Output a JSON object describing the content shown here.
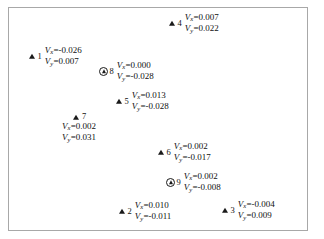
{
  "figure": {
    "background_color": "#ffffff",
    "border_color": "#a8a8a8",
    "marker_color": "#1a1a1a",
    "symbol_vx": "V",
    "symbol_vy": "V",
    "sub_x": "x",
    "sub_y": "y",
    "eq": "="
  },
  "chart_data": {
    "type": "scatter",
    "title": "",
    "xlabel": "",
    "ylabel": "",
    "grid": false,
    "legend": null,
    "annotation_format": "Vx=<value>, Vy=<value>",
    "points": [
      {
        "id": "1",
        "label": "1",
        "marker": "triangle",
        "vx": "-0.026",
        "vy": "0.007",
        "vx_text": "V_x=-0.026",
        "vy_text": "V_y=0.007",
        "px": 27,
        "py": 45,
        "layout": "inline"
      },
      {
        "id": "8",
        "label": "8",
        "marker": "circled-triangle",
        "vx": "0.000",
        "vy": "-0.028",
        "vx_text": "V_x=0.000",
        "vy_text": "V_y=-0.028",
        "px": 99,
        "py": 60,
        "layout": "inline"
      },
      {
        "id": "4",
        "label": "4",
        "marker": "triangle",
        "vx": "0.007",
        "vy": "0.022",
        "vx_text": "V_x=0.007",
        "vy_text": "V_y=0.022",
        "px": 167,
        "py": 12,
        "layout": "inline"
      },
      {
        "id": "5",
        "label": "5",
        "marker": "triangle",
        "vx": "0.013",
        "vy": "-0.028",
        "vx_text": "V_x=0.013",
        "vy_text": "V_y=-0.028",
        "px": 114,
        "py": 90,
        "layout": "inline"
      },
      {
        "id": "7",
        "label": "7",
        "marker": "triangle",
        "vx": "0.002",
        "vy": "0.031",
        "vx_text": "V_x=0.002",
        "vy_text": "V_y=0.031",
        "px": 62,
        "py": 112,
        "layout": "stacked"
      },
      {
        "id": "6",
        "label": "6",
        "marker": "triangle",
        "vx": "0.002",
        "vy": "-0.017",
        "vx_text": "V_x=0.002",
        "vy_text": "V_y=-0.017",
        "px": 156,
        "py": 141,
        "layout": "inline"
      },
      {
        "id": "9",
        "label": "9",
        "marker": "circled-triangle",
        "vx": "0.002",
        "vy": "-0.008",
        "vx_text": "V_x=0.002",
        "vy_text": "V_y=-0.008",
        "px": 166,
        "py": 171,
        "layout": "inline"
      },
      {
        "id": "2",
        "label": "2",
        "marker": "triangle",
        "vx": "0.010",
        "vy": "-0.011",
        "vx_text": "V_x=0.010",
        "vy_text": "V_y=-0.011",
        "px": 117,
        "py": 200,
        "layout": "inline"
      },
      {
        "id": "3",
        "label": "3",
        "marker": "triangle",
        "vx": "-0.004",
        "vy": "0.009",
        "vx_text": "V_x=-0.004",
        "vy_text": "V_y=0.009",
        "px": 220,
        "py": 199,
        "layout": "inline"
      }
    ]
  }
}
